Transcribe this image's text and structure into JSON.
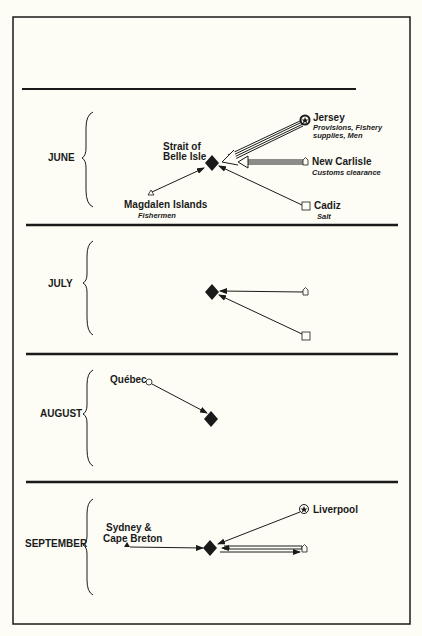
{
  "months": [
    {
      "label": "JUNE"
    },
    {
      "label": "JULY"
    },
    {
      "label": "AUGUST"
    },
    {
      "label": "SEPTEMBER"
    }
  ],
  "june": {
    "hub": {
      "line1": "Strait of",
      "line2": "Belle Isle"
    },
    "jersey": {
      "name": "Jersey",
      "note1": "Provisions, Fishery",
      "note2": "supplies, Men"
    },
    "new_carlisle": {
      "name": "New Carlisle",
      "note": "Customs clearance"
    },
    "cadiz": {
      "name": "Cadiz",
      "note": "Salt"
    },
    "magdalen": {
      "name": "Magdalen Islands",
      "note": "Fishermen"
    }
  },
  "august": {
    "quebec": {
      "name": "Québec"
    }
  },
  "september": {
    "liverpool": {
      "name": "Liverpool"
    },
    "sydney": {
      "line1": "Sydney &",
      "line2": "Cape Breton"
    }
  },
  "colors": {
    "ink": "#1a1a1a",
    "paper": "#fdfdf6"
  }
}
